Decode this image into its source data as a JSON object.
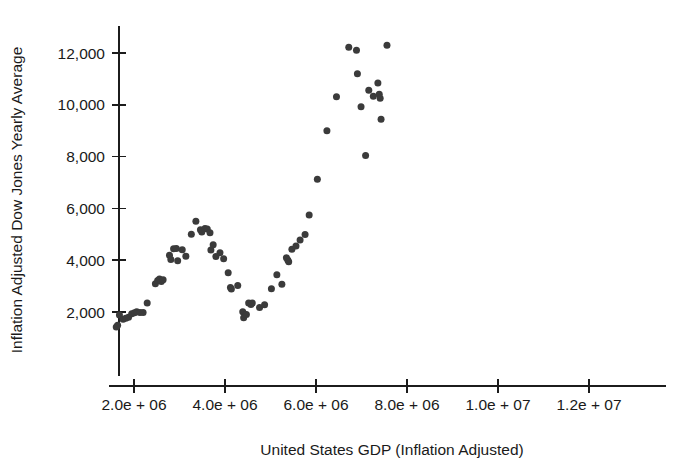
{
  "chart_data": {
    "type": "scatter",
    "title": "",
    "xlabel": "United States GDP (Inflation Adjusted)",
    "ylabel": "Inflation Adjusted Dow Jones Yearly Average",
    "grid": false,
    "legend": "none",
    "xlim": [
      1450000,
      13400000
    ],
    "ylim": [
      1150,
      12900
    ],
    "xticks": [
      2000000,
      4000000,
      6000000,
      8000000,
      10000000,
      12000000
    ],
    "xtick_labels": [
      "2.0e + 06",
      "4.0e + 06",
      "6.0e + 06",
      "8.0e + 06",
      "1.0e + 07",
      "1.2e + 07"
    ],
    "yticks": [
      2000,
      4000,
      6000,
      8000,
      10000,
      12000
    ],
    "ytick_labels": [
      "2,000",
      "4,000",
      "6,000",
      "8,000",
      "10,000",
      "12,000"
    ],
    "marker": {
      "shape": "circle",
      "color": "#3b3b3b",
      "size_px": 7
    },
    "points": [
      {
        "x": 1610000,
        "y": 1420
      },
      {
        "x": 1640000,
        "y": 1490
      },
      {
        "x": 1680000,
        "y": 1880
      },
      {
        "x": 1760000,
        "y": 1720
      },
      {
        "x": 1820000,
        "y": 1760
      },
      {
        "x": 1880000,
        "y": 1800
      },
      {
        "x": 1950000,
        "y": 1930
      },
      {
        "x": 2010000,
        "y": 1970
      },
      {
        "x": 2060000,
        "y": 2010
      },
      {
        "x": 2130000,
        "y": 1980
      },
      {
        "x": 2200000,
        "y": 1980
      },
      {
        "x": 2290000,
        "y": 2350
      },
      {
        "x": 2470000,
        "y": 3090
      },
      {
        "x": 2520000,
        "y": 3220
      },
      {
        "x": 2560000,
        "y": 3270
      },
      {
        "x": 2600000,
        "y": 3180
      },
      {
        "x": 2640000,
        "y": 3250
      },
      {
        "x": 2780000,
        "y": 4190
      },
      {
        "x": 2810000,
        "y": 4030
      },
      {
        "x": 2870000,
        "y": 4440
      },
      {
        "x": 2930000,
        "y": 4450
      },
      {
        "x": 2960000,
        "y": 3980
      },
      {
        "x": 3060000,
        "y": 4400
      },
      {
        "x": 3140000,
        "y": 4150
      },
      {
        "x": 3260000,
        "y": 5000
      },
      {
        "x": 3360000,
        "y": 5500
      },
      {
        "x": 3460000,
        "y": 5180
      },
      {
        "x": 3490000,
        "y": 5090
      },
      {
        "x": 3560000,
        "y": 5220
      },
      {
        "x": 3610000,
        "y": 5200
      },
      {
        "x": 3670000,
        "y": 5060
      },
      {
        "x": 3690000,
        "y": 4390
      },
      {
        "x": 3740000,
        "y": 4600
      },
      {
        "x": 3800000,
        "y": 4140
      },
      {
        "x": 3890000,
        "y": 4290
      },
      {
        "x": 3970000,
        "y": 4060
      },
      {
        "x": 4070000,
        "y": 3520
      },
      {
        "x": 4120000,
        "y": 2950
      },
      {
        "x": 4140000,
        "y": 2890
      },
      {
        "x": 4280000,
        "y": 3020
      },
      {
        "x": 4390000,
        "y": 2010
      },
      {
        "x": 4410000,
        "y": 1780
      },
      {
        "x": 4470000,
        "y": 1900
      },
      {
        "x": 4520000,
        "y": 2350
      },
      {
        "x": 4570000,
        "y": 2290
      },
      {
        "x": 4600000,
        "y": 2350
      },
      {
        "x": 4760000,
        "y": 2170
      },
      {
        "x": 4870000,
        "y": 2280
      },
      {
        "x": 5020000,
        "y": 2900
      },
      {
        "x": 5140000,
        "y": 3440
      },
      {
        "x": 5250000,
        "y": 3070
      },
      {
        "x": 5350000,
        "y": 4090
      },
      {
        "x": 5380000,
        "y": 4010
      },
      {
        "x": 5400000,
        "y": 3940
      },
      {
        "x": 5470000,
        "y": 4420
      },
      {
        "x": 5560000,
        "y": 4550
      },
      {
        "x": 5650000,
        "y": 4780
      },
      {
        "x": 5760000,
        "y": 4990
      },
      {
        "x": 5850000,
        "y": 5750
      },
      {
        "x": 6030000,
        "y": 7130
      },
      {
        "x": 6240000,
        "y": 9000
      },
      {
        "x": 6450000,
        "y": 10310
      },
      {
        "x": 6720000,
        "y": 12220
      },
      {
        "x": 6890000,
        "y": 12110
      },
      {
        "x": 6910000,
        "y": 11200
      },
      {
        "x": 6990000,
        "y": 9920
      },
      {
        "x": 7090000,
        "y": 8040
      },
      {
        "x": 7160000,
        "y": 10560
      },
      {
        "x": 7260000,
        "y": 10330
      },
      {
        "x": 7360000,
        "y": 10840
      },
      {
        "x": 7390000,
        "y": 10410
      },
      {
        "x": 7410000,
        "y": 10250
      },
      {
        "x": 7430000,
        "y": 9440
      },
      {
        "x": 7560000,
        "y": 12300
      }
    ]
  }
}
